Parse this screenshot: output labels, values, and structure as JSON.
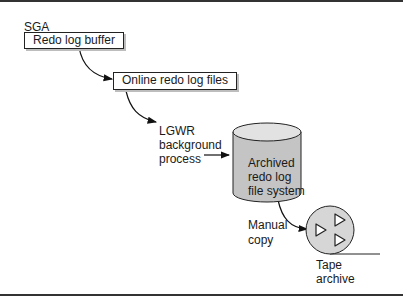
{
  "diagram": {
    "sga_label": "SGA",
    "redo_log_buffer": "Redo log buffer",
    "online_redo_log_files": "Online redo log files",
    "lgwr": {
      "line1": "LGWR",
      "line2": "background",
      "line3": "process"
    },
    "archived_fs": {
      "line1": "Archived",
      "line2": "redo log",
      "line3": "file system"
    },
    "manual_copy": {
      "line1": "Manual",
      "line2": "copy"
    },
    "tape_archive": {
      "line1": "Tape",
      "line2": "archive"
    },
    "colors": {
      "cylinder_fill": "#c4c4c4",
      "cylinder_top": "#e2e2e2",
      "tape_fill": "#d6d6d6",
      "shadow": "#bdbdbd"
    }
  }
}
